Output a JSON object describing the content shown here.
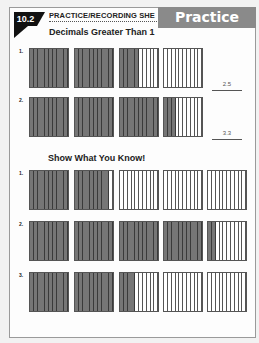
{
  "header": {
    "lesson_badge": "10.2",
    "sheet_title": "PRACTICE/RECORDING SHE",
    "banner_label": "Practice",
    "section_title": "Decimals Greater Than 1"
  },
  "section2": {
    "title": "Show What You Know!"
  },
  "colors": {
    "shaded": "#767676",
    "banner": "#8a8a8a",
    "badge": "#111111"
  },
  "practice_rows": [
    {
      "label": "1.",
      "shaded_tenths": [
        10,
        10,
        5,
        0
      ],
      "answer": "2.5"
    },
    {
      "label": "2.",
      "shaded_tenths": [
        10,
        10,
        10,
        3
      ],
      "answer": "3.3"
    }
  ],
  "swyk_rows": [
    {
      "label": "1.",
      "shaded_tenths": [
        10,
        9,
        0,
        0,
        0
      ]
    },
    {
      "label": "2.",
      "shaded_tenths": [
        10,
        10,
        10,
        10,
        2
      ]
    },
    {
      "label": "3.",
      "shaded_tenths": [
        10,
        10,
        4,
        0,
        0
      ]
    }
  ]
}
